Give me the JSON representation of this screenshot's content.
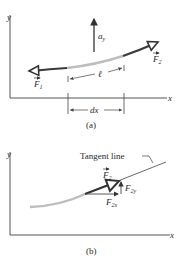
{
  "panel_a": {
    "caption": "(a)",
    "axis_x_label": "x",
    "axis_y_label": "y",
    "accel_label": "a",
    "accel_sub": "y",
    "length_label": "ℓ",
    "dx_label": "dx",
    "force_left": {
      "name": "F",
      "sub": "1"
    },
    "force_right": {
      "name": "F",
      "sub": "2"
    }
  },
  "panel_b": {
    "caption": "(b)",
    "axis_x_label": "x",
    "axis_y_label": "y",
    "tangent_label": "Tangent line",
    "force": {
      "name": "F",
      "sub": "2"
    },
    "component_y": {
      "name": "F",
      "sub": "2y"
    },
    "component_x": {
      "name": "F",
      "sub": "2x"
    }
  },
  "colors": {
    "axis": "#555555",
    "string_dark": "#3a3a3a",
    "string_light": "#bdbdbd",
    "text": "#2a2a2a"
  }
}
